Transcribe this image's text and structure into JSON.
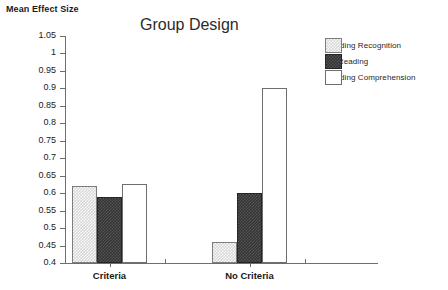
{
  "chart_data": {
    "type": "bar",
    "title": "Group Design",
    "xlabel": "",
    "ylabel": "Mean Effect Size",
    "ylim": [
      0.4,
      1.05
    ],
    "ytick_step": 0.05,
    "yticks": [
      "1.05",
      "1",
      "0.95",
      "0.9",
      "0.85",
      "0.8",
      "0.75",
      "0.7",
      "0.65",
      "0.6",
      "0.55",
      "0.5",
      "0.45",
      "0.4"
    ],
    "ytick_values": [
      1.05,
      1.0,
      0.95,
      0.9,
      0.85,
      0.8,
      0.75,
      0.7,
      0.65,
      0.6,
      0.55,
      0.5,
      0.45,
      0.4
    ],
    "categories": [
      "Criteria",
      "No Criteria"
    ],
    "grid": false,
    "legend_position": "right-top",
    "series": [
      {
        "name": "Reading Recognition",
        "fill": "hatched-light-gray",
        "values": [
          0.62,
          0.46
        ]
      },
      {
        "name": "No Reading",
        "fill": "solid-dark-gray",
        "values": [
          0.59,
          0.6
        ]
      },
      {
        "name": "Reading Comprehension",
        "fill": "white-outline",
        "values": [
          0.625,
          0.9
        ]
      }
    ]
  },
  "legend": {
    "items": [
      {
        "label": "Reading Recognition"
      },
      {
        "label": "No Reading"
      },
      {
        "label": "Reading Comprehension"
      }
    ]
  },
  "colors": {
    "axis": "#6e6e6e",
    "text": "#1a1a1a",
    "recognition_fill": "#d7d7d7",
    "noreading_fill": "#343434",
    "comprehension_fill": "#ffffff"
  }
}
